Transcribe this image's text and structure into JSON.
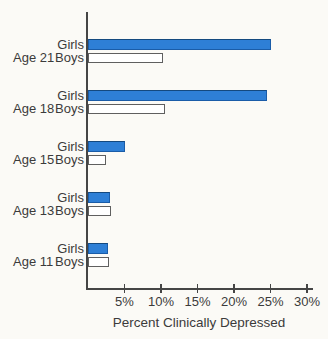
{
  "figure": {
    "x_axis_title": "Percent Clinically Depressed"
  },
  "chart_data": {
    "type": "bar",
    "orientation": "horizontal",
    "title": "",
    "xlabel": "Percent Clinically Depressed",
    "ylabel": "",
    "xlim": [
      0,
      30
    ],
    "x_ticks": [
      5,
      10,
      15,
      20,
      25,
      30
    ],
    "x_tick_labels": [
      "5%",
      "10%",
      "15%",
      "20%",
      "25%",
      "30%"
    ],
    "grid": false,
    "legend_position": "inline-row-labels",
    "categories": [
      "Age 21",
      "Age 18",
      "Age 15",
      "Age 13",
      "Age 11"
    ],
    "series": [
      {
        "name": "Girls",
        "color": "#2e7fd6",
        "values": [
          25,
          24.5,
          5,
          3,
          2.7
        ]
      },
      {
        "name": "Boys",
        "color": "#ffffff",
        "values": [
          10.3,
          10.5,
          2.5,
          3.1,
          2.9
        ]
      }
    ]
  },
  "colors": {
    "girls_bar_fill": "#2e7fd6",
    "girls_bar_border": "#1a5ca8",
    "boys_bar_fill": "#ffffff",
    "boys_bar_border": "#5f5f5f",
    "axis": "#454545",
    "text": "#3b3b3b",
    "background": "#fbfaf6"
  }
}
